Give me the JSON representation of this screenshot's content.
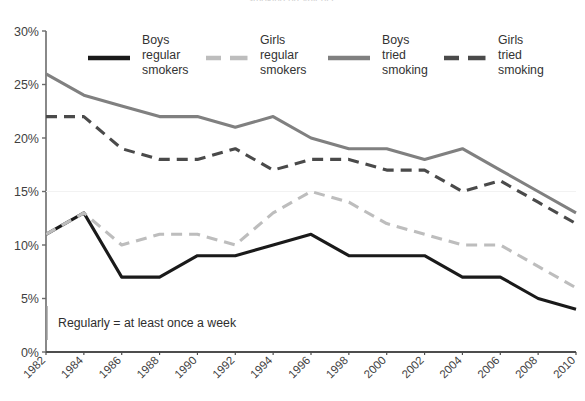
{
  "title_clipped": "smoking prevalence",
  "note": {
    "text": "Regularly = at least once a week"
  },
  "legend": {
    "position": "top-inside",
    "entries": [
      {
        "label_line1": "Boys",
        "label_line2": "regular",
        "label_line3": "smokers",
        "style": "solid",
        "color": "#1a1a1a",
        "width": 3.2
      },
      {
        "label_line1": "Girls",
        "label_line2": "regular",
        "label_line3": "smokers",
        "style": "dashed",
        "color": "#bdbdbd",
        "width": 3.2
      },
      {
        "label_line1": "Boys",
        "label_line2": "tried",
        "label_line3": "smoking",
        "style": "solid",
        "color": "#808080",
        "width": 3.2
      },
      {
        "label_line1": "Girls",
        "label_line2": "tried",
        "label_line3": "smoking",
        "style": "dashed",
        "color": "#4a4a4a",
        "width": 3.2
      }
    ]
  },
  "axes": {
    "y_ticks": [
      "0%",
      "5%",
      "10%",
      "15%",
      "20%",
      "25%",
      "30%"
    ],
    "y_values": [
      0,
      5,
      10,
      15,
      20,
      25,
      30
    ],
    "x_ticks": [
      "1982",
      "1984",
      "1986",
      "1988",
      "1990",
      "1992",
      "1994",
      "1996",
      "1998",
      "2000",
      "2002",
      "2004",
      "2006",
      "2008",
      "2010"
    ]
  },
  "chart_data": {
    "type": "line",
    "title": "",
    "xlabel": "",
    "ylabel": "",
    "ylim": [
      0,
      30
    ],
    "grid": false,
    "legend_position": "top-inside",
    "annotations": [
      "Regularly = at least once a week"
    ],
    "categories": [
      "1982",
      "1984",
      "1986",
      "1988",
      "1990",
      "1992",
      "1994",
      "1996",
      "1998",
      "2000",
      "2002",
      "2004",
      "2006",
      "2008",
      "2010"
    ],
    "x": [
      1982,
      1984,
      1986,
      1988,
      1990,
      1992,
      1994,
      1996,
      1998,
      2000,
      2002,
      2004,
      2006,
      2008,
      2010
    ],
    "y_tick_labels": [
      "0%",
      "5%",
      "10%",
      "15%",
      "20%",
      "25%",
      "30%"
    ],
    "series": [
      {
        "name": "Boys regular smokers",
        "color": "#1a1a1a",
        "style": "solid",
        "values": [
          11,
          13,
          7,
          7,
          9,
          9,
          10,
          11,
          9,
          9,
          9,
          7,
          7,
          5,
          4
        ]
      },
      {
        "name": "Girls regular smokers",
        "color": "#bdbdbd",
        "style": "dashed",
        "values": [
          11,
          13,
          10,
          11,
          11,
          10,
          13,
          15,
          14,
          12,
          11,
          10,
          10,
          8,
          6
        ]
      },
      {
        "name": "Boys tried smoking",
        "color": "#808080",
        "style": "solid",
        "values": [
          26,
          24,
          23,
          22,
          22,
          21,
          22,
          20,
          19,
          19,
          18,
          19,
          17,
          15,
          13
        ]
      },
      {
        "name": "Girls tried smoking",
        "color": "#4a4a4a",
        "style": "dashed",
        "values": [
          22,
          22,
          19,
          18,
          18,
          19,
          17,
          18,
          18,
          17,
          17,
          15,
          16,
          14,
          12
        ]
      }
    ]
  }
}
